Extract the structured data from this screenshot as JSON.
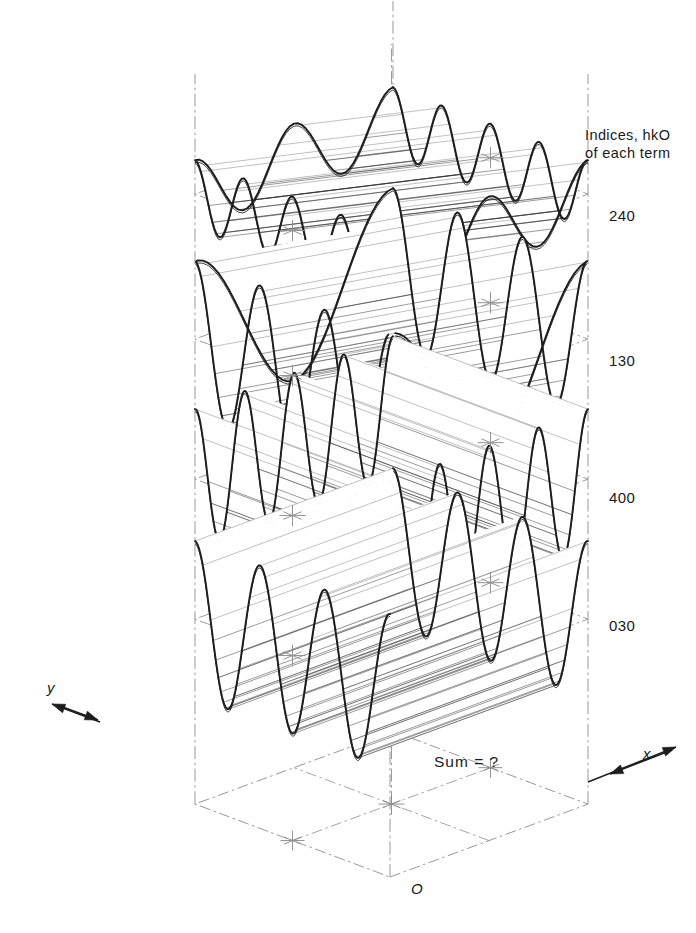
{
  "figure": {
    "title_lines": [
      "Indices, hkO",
      "of each term"
    ],
    "sum_label": "Sum = ?",
    "origin_label": "O",
    "axes": [
      {
        "name": "y-axis",
        "label": "y"
      },
      {
        "name": "x-axis",
        "label": "x"
      }
    ],
    "ink": "#1d1d1d",
    "construction_color": "#8d8d8d",
    "hatch_color": "#2a2a2a",
    "background": "#ffffff"
  },
  "chart_data": {
    "type": "line",
    "xlabel": "x",
    "ylabel": "y",
    "projection": "isometric",
    "legend_title": "Indices, hkO of each term",
    "annotations": [
      "Sum = ?",
      "O"
    ],
    "series": [
      {
        "name": "240",
        "label": "240",
        "h": 2,
        "k": 4,
        "l": 0,
        "cycles_along_x": 2,
        "cycles_along_y": 4,
        "orientation": "oblique",
        "layer_index": 0,
        "amplitude_rel": 0.45
      },
      {
        "name": "130",
        "label": "130",
        "h": 1,
        "k": 3,
        "l": 0,
        "cycles_along_x": 1,
        "cycles_along_y": 3,
        "orientation": "oblique",
        "layer_index": 1,
        "amplitude_rel": 1.0
      },
      {
        "name": "400",
        "label": "400",
        "h": 4,
        "k": 0,
        "l": 0,
        "cycles_along_x": 4,
        "cycles_along_y": 0,
        "orientation": "along-y",
        "layer_index": 2,
        "amplitude_rel": 0.9
      },
      {
        "name": "030",
        "label": "030",
        "h": 0,
        "k": 3,
        "l": 0,
        "cycles_along_x": 0,
        "cycles_along_y": 3,
        "orientation": "along-x",
        "layer_index": 3,
        "amplitude_rel": 1.0
      },
      {
        "name": "sum",
        "label": "Sum = ?",
        "layer_index": 4,
        "amplitude_rel": 0,
        "orientation": "flat-empty"
      }
    ],
    "layer_labels": [
      "240",
      "130",
      "400",
      "030"
    ],
    "grid": true,
    "legend_position": "right"
  }
}
